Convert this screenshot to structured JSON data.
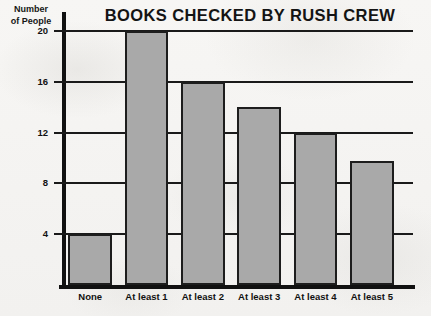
{
  "chart_data": {
    "type": "bar",
    "title": "BOOKS CHECKED BY RUSH CREW",
    "xlabel": "",
    "ylabel": "Number of People",
    "ylabel_lines": [
      "Number",
      "of People"
    ],
    "categories": [
      "None",
      "At least 1",
      "At least 2",
      "At least 3",
      "At least 4",
      "At least 5"
    ],
    "values": [
      4,
      20,
      16,
      14,
      12,
      9.8
    ],
    "ylim": [
      0,
      21.5
    ],
    "yticks": [
      4,
      8,
      12,
      16,
      20
    ],
    "ytick_labels": [
      "4",
      "8",
      "12",
      "16",
      "20"
    ],
    "grid": true,
    "grid_axis": "y",
    "legend": null,
    "bar_color": "#a9a9a9",
    "bar_edge_color": "#1d1d1d",
    "axis_color": "#111111",
    "background_color": "#f6f5f3",
    "text_color": "#141414"
  }
}
